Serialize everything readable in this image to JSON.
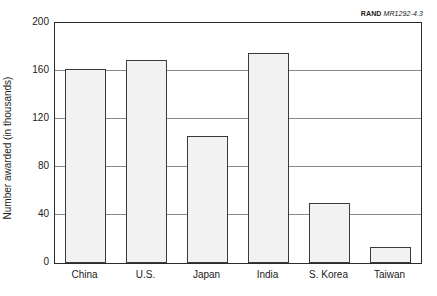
{
  "credit": {
    "mark": "RAND",
    "document": "MR1292-4.3"
  },
  "chart_data": {
    "type": "bar",
    "title": "",
    "subtitle": "",
    "xlabel": "",
    "ylabel": "Number awarded (in thousands)",
    "categories": [
      "China",
      "U.S.",
      "Japan",
      "India",
      "S. Korea",
      "Taiwan"
    ],
    "values": [
      162,
      169,
      106,
      175,
      50,
      13
    ],
    "series": [
      {
        "name": "Number awarded (in thousands)",
        "values": [
          162,
          169,
          106,
          175,
          50,
          13
        ]
      }
    ],
    "ylim": [
      0,
      200
    ],
    "yticks": [
      0,
      40,
      80,
      120,
      160,
      200
    ],
    "ytick_labels": [
      "0",
      "40",
      "80",
      "120",
      "160",
      "200"
    ],
    "grid": "horizontal",
    "legend": "none",
    "bar_fill_color": "#f2f2f2",
    "bar_border_color": "#3a3a3a",
    "gridline_color": "#8c8c8c",
    "frame_color": "#2b2b2b"
  }
}
